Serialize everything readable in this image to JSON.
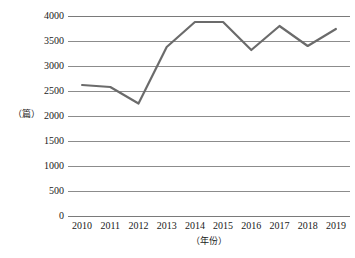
{
  "chart_data": {
    "type": "line",
    "title": "",
    "xlabel": "（年份）",
    "ylabel": "（篇）",
    "categories": [
      "2010",
      "2011",
      "2012",
      "2013",
      "2014",
      "2015",
      "2016",
      "2017",
      "2018",
      "2019"
    ],
    "values": [
      2620,
      2580,
      2250,
      3380,
      3880,
      3880,
      3320,
      3800,
      3400,
      3740
    ],
    "series": [
      {
        "name": "论文数量",
        "values": [
          2620,
          2580,
          2250,
          3380,
          3880,
          3880,
          3320,
          3800,
          3400,
          3740
        ]
      }
    ],
    "ylim": [
      0,
      4000
    ],
    "ytick_labels": [
      "4000",
      "3500",
      "3000",
      "2500",
      "2000",
      "1500",
      "1000",
      "500",
      "0"
    ],
    "ytick_values": [
      4000,
      3500,
      3000,
      2500,
      2000,
      1500,
      1000,
      500,
      0
    ],
    "grid": "horizontal",
    "legend": "none",
    "line_color": "#6b6b6b",
    "grid_color": "#8c8c8c",
    "axis_color": "#7a7a7a",
    "background": "#ffffff"
  }
}
